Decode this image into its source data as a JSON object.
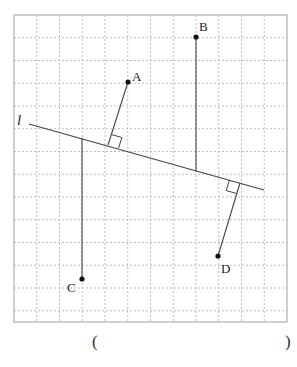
{
  "figure": {
    "grid": {
      "x0": 14,
      "y0": 15,
      "cell": 22.75,
      "cols": 12,
      "rows": 13.5,
      "line_color": "#bdbdbd",
      "border_color": "#b0b0b0"
    },
    "line_l": {
      "label": "l",
      "x1": 29,
      "y1": 124,
      "x2": 264,
      "y2": 190
    },
    "points": [
      {
        "name": "A",
        "x": 128,
        "y": 82,
        "foot_x": 108,
        "foot_y": 145,
        "label_x": 132,
        "label_y": 70
      },
      {
        "name": "B",
        "x": 196,
        "y": 37,
        "foot_x": 196,
        "foot_y": 171,
        "label_x": 199,
        "label_y": 20
      },
      {
        "name": "C",
        "x": 82,
        "y": 279,
        "foot_x": 82,
        "foot_y": 138,
        "label_x": 67,
        "label_y": 281
      },
      {
        "name": "D",
        "x": 218,
        "y": 256,
        "foot_x": 240,
        "foot_y": 183,
        "label_x": 221,
        "label_y": 262
      }
    ],
    "stroke_color": "#444444"
  },
  "answer": {
    "open": "(",
    "close": ")"
  }
}
